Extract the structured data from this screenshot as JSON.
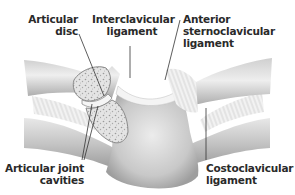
{
  "diagram": {
    "labels": {
      "articular_disc": [
        "Articular",
        "disc"
      ],
      "interclavicular_ligament": [
        "Interclavicular",
        "ligament"
      ],
      "anterior_sternoclavicular_ligament": [
        "Anterior",
        "sternoclavicular",
        "ligament"
      ],
      "articular_joint_cavities": [
        "Articular joint",
        "cavities"
      ],
      "costoclavicular_ligament": [
        "Costoclavicular",
        "ligament"
      ]
    },
    "colors": {
      "bone_light": "#e6e6e6",
      "bone_mid": "#bdbdbd",
      "bone_dark": "#8f8f8f",
      "cancellous": "#d9d9d9",
      "leader_line": "#333333",
      "text": "#2a2a2a"
    }
  }
}
